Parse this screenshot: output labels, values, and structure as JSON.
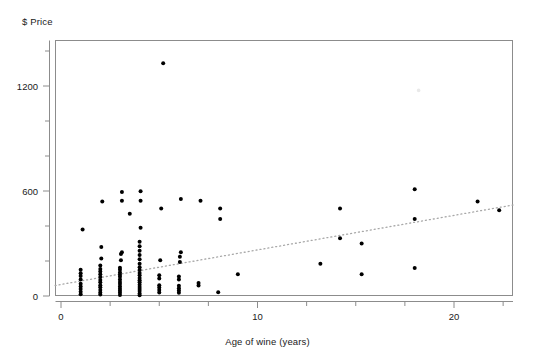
{
  "chart_data": {
    "type": "scatter",
    "title": "",
    "ylabel": "$ Price",
    "xlabel": "Age of wine (years)",
    "xlim": [
      -0.3,
      23.0
    ],
    "ylim": [
      -40,
      1500
    ],
    "xticks": [
      0,
      10,
      20
    ],
    "xtick_labels": [
      "0",
      "10",
      "20"
    ],
    "xminor_ticks": [
      2.5,
      5,
      7.5,
      12.5,
      15,
      17.5,
      22.5
    ],
    "yticks": [
      0,
      600,
      1200
    ],
    "ytick_labels": [
      "0",
      "600",
      "1200"
    ],
    "yminor_ticks": [
      200,
      400,
      800,
      1000,
      1400
    ],
    "grid": false,
    "legend": null,
    "marker_color": "#000000",
    "frame_color": "#8c8c8c",
    "trendline": {
      "style": "dotted",
      "color": "#a8a8a8",
      "x_start": -0.3,
      "y_start": 60,
      "x_end": 23.0,
      "y_end": 520
    },
    "points": [
      {
        "x": 1.0,
        "y": 10
      },
      {
        "x": 1.0,
        "y": 25
      },
      {
        "x": 1.0,
        "y": 40
      },
      {
        "x": 1.0,
        "y": 55
      },
      {
        "x": 1.0,
        "y": 70
      },
      {
        "x": 1.0,
        "y": 95
      },
      {
        "x": 1.0,
        "y": 115
      },
      {
        "x": 1.0,
        "y": 130
      },
      {
        "x": 1.0,
        "y": 150
      },
      {
        "x": 1.1,
        "y": 380
      },
      {
        "x": 2.0,
        "y": 8
      },
      {
        "x": 2.0,
        "y": 20
      },
      {
        "x": 2.0,
        "y": 35
      },
      {
        "x": 2.0,
        "y": 50
      },
      {
        "x": 2.0,
        "y": 62
      },
      {
        "x": 2.0,
        "y": 78
      },
      {
        "x": 2.0,
        "y": 92
      },
      {
        "x": 2.0,
        "y": 108
      },
      {
        "x": 2.0,
        "y": 125
      },
      {
        "x": 2.0,
        "y": 140
      },
      {
        "x": 2.0,
        "y": 155
      },
      {
        "x": 2.0,
        "y": 175
      },
      {
        "x": 2.05,
        "y": 215
      },
      {
        "x": 2.05,
        "y": 280
      },
      {
        "x": 2.1,
        "y": 540
      },
      {
        "x": 3.0,
        "y": 6
      },
      {
        "x": 3.0,
        "y": 18
      },
      {
        "x": 3.0,
        "y": 30
      },
      {
        "x": 3.0,
        "y": 42
      },
      {
        "x": 3.0,
        "y": 55
      },
      {
        "x": 3.0,
        "y": 68
      },
      {
        "x": 3.0,
        "y": 80
      },
      {
        "x": 3.0,
        "y": 95
      },
      {
        "x": 3.0,
        "y": 110
      },
      {
        "x": 3.0,
        "y": 122
      },
      {
        "x": 3.0,
        "y": 135
      },
      {
        "x": 3.0,
        "y": 150
      },
      {
        "x": 3.0,
        "y": 162
      },
      {
        "x": 3.05,
        "y": 205
      },
      {
        "x": 3.05,
        "y": 240
      },
      {
        "x": 3.1,
        "y": 250
      },
      {
        "x": 3.1,
        "y": 545
      },
      {
        "x": 3.1,
        "y": 595
      },
      {
        "x": 3.5,
        "y": 470
      },
      {
        "x": 4.0,
        "y": 5
      },
      {
        "x": 4.0,
        "y": 15
      },
      {
        "x": 4.0,
        "y": 28
      },
      {
        "x": 4.0,
        "y": 40
      },
      {
        "x": 4.0,
        "y": 52
      },
      {
        "x": 4.0,
        "y": 65
      },
      {
        "x": 4.0,
        "y": 78
      },
      {
        "x": 4.0,
        "y": 90
      },
      {
        "x": 4.0,
        "y": 103
      },
      {
        "x": 4.0,
        "y": 118
      },
      {
        "x": 4.0,
        "y": 132
      },
      {
        "x": 4.0,
        "y": 148
      },
      {
        "x": 4.0,
        "y": 165
      },
      {
        "x": 4.0,
        "y": 185
      },
      {
        "x": 4.0,
        "y": 210
      },
      {
        "x": 4.0,
        "y": 235
      },
      {
        "x": 4.0,
        "y": 258
      },
      {
        "x": 4.0,
        "y": 285
      },
      {
        "x": 4.0,
        "y": 310
      },
      {
        "x": 4.05,
        "y": 390
      },
      {
        "x": 4.05,
        "y": 545
      },
      {
        "x": 4.05,
        "y": 598
      },
      {
        "x": 5.0,
        "y": 20
      },
      {
        "x": 5.0,
        "y": 35
      },
      {
        "x": 5.0,
        "y": 48
      },
      {
        "x": 5.0,
        "y": 62
      },
      {
        "x": 5.0,
        "y": 100
      },
      {
        "x": 5.0,
        "y": 118
      },
      {
        "x": 5.05,
        "y": 205
      },
      {
        "x": 5.1,
        "y": 500
      },
      {
        "x": 5.2,
        "y": 1330
      },
      {
        "x": 6.0,
        "y": 18
      },
      {
        "x": 6.0,
        "y": 32
      },
      {
        "x": 6.0,
        "y": 45
      },
      {
        "x": 6.0,
        "y": 58
      },
      {
        "x": 6.0,
        "y": 95
      },
      {
        "x": 6.0,
        "y": 112
      },
      {
        "x": 6.05,
        "y": 195
      },
      {
        "x": 6.05,
        "y": 225
      },
      {
        "x": 6.1,
        "y": 250
      },
      {
        "x": 6.1,
        "y": 555
      },
      {
        "x": 7.0,
        "y": 60
      },
      {
        "x": 7.0,
        "y": 75
      },
      {
        "x": 7.1,
        "y": 545
      },
      {
        "x": 8.0,
        "y": 22
      },
      {
        "x": 8.1,
        "y": 440
      },
      {
        "x": 8.1,
        "y": 500
      },
      {
        "x": 9.0,
        "y": 125
      },
      {
        "x": 13.2,
        "y": 185
      },
      {
        "x": 14.2,
        "y": 330
      },
      {
        "x": 14.2,
        "y": 500
      },
      {
        "x": 15.3,
        "y": 125
      },
      {
        "x": 15.3,
        "y": 300
      },
      {
        "x": 18.0,
        "y": 160
      },
      {
        "x": 18.0,
        "y": 440
      },
      {
        "x": 18.0,
        "y": 610
      },
      {
        "x": 21.2,
        "y": 540
      },
      {
        "x": 22.3,
        "y": 490
      }
    ],
    "faint_artifacts": [
      {
        "x": 18.2,
        "y": 1175
      }
    ]
  }
}
